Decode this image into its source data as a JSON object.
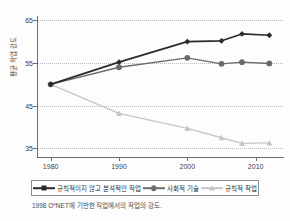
{
  "chart_data": {
    "type": "line",
    "title": "",
    "xlabel": "",
    "ylabel": "평균 작업 강도",
    "x": [
      1980,
      1990,
      2000,
      2005,
      2008,
      2012
    ],
    "xticks": [
      "1980",
      "1990",
      "2000",
      "2010"
    ],
    "xtick_values": [
      1980,
      1990,
      2000,
      2010
    ],
    "yticks": [
      "65",
      "55",
      "45",
      "35"
    ],
    "ytick_values": [
      65,
      55,
      45,
      35
    ],
    "xlim": [
      1978,
      2014
    ],
    "ylim": [
      33,
      66
    ],
    "grid": "horizontal-dotted",
    "legend_position": "below-plot",
    "series": [
      {
        "name": "규칙적이지 않고 분석적인 작업",
        "color": "#2b2b2b",
        "marker": "diamond",
        "values": [
          50.0,
          55.2,
          60.0,
          60.2,
          61.8,
          61.5
        ]
      },
      {
        "name": "사회적 기술",
        "color": "#6b6b6b",
        "marker": "circle",
        "values": [
          50.0,
          54.0,
          56.2,
          54.8,
          55.2,
          54.9
        ]
      },
      {
        "name": "규칙적 작업",
        "color": "#c6c6c6",
        "marker": "triangle",
        "values": [
          50.0,
          43.2,
          39.7,
          37.5,
          36.2,
          36.3
        ]
      }
    ],
    "annotations": []
  },
  "caption": "1998 O*NET에 기반한 직업에서의 작업의 강도.",
  "colors": {
    "axis": "#6f6f6f",
    "grid": "#b9bcc6",
    "text": "#3d3d3d",
    "background": "#fdfdfd",
    "series_dark": "#2b2b2b",
    "series_mid": "#6b6b6b",
    "series_light": "#c6c6c6"
  }
}
